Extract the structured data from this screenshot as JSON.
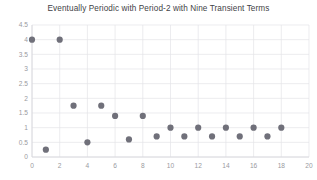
{
  "chart_data": {
    "type": "scatter",
    "title": "Eventually Periodic with Period-2 with Nine Transient Terms",
    "xlabel": "",
    "ylabel": "",
    "xlim": [
      0,
      20
    ],
    "ylim": [
      0,
      4.5
    ],
    "xticks": [
      0,
      2,
      4,
      6,
      8,
      10,
      12,
      14,
      16,
      18,
      20
    ],
    "yticks": [
      0,
      0.5,
      1,
      1.5,
      2,
      2.5,
      3,
      3.5,
      4,
      4.5
    ],
    "xtick_labels": [
      "0",
      "2",
      "4",
      "6",
      "8",
      "10",
      "12",
      "14",
      "16",
      "18",
      "20"
    ],
    "ytick_labels": [
      "0",
      "0.5",
      "1",
      "1.5",
      "2",
      "2.5",
      "3",
      "3.5",
      "4",
      "4.5"
    ],
    "grid": true,
    "legend": false,
    "marker_color": "#70707a",
    "marker_size": 3.1,
    "x": [
      0,
      1,
      2,
      3,
      4,
      5,
      6,
      7,
      8,
      9,
      10,
      11,
      12,
      13,
      14,
      15,
      16,
      17,
      18
    ],
    "y": [
      4,
      0.25,
      4,
      1.75,
      0.5,
      1.75,
      1.4,
      0.6,
      1.4,
      0.7,
      1,
      0.7,
      1,
      0.7,
      1,
      0.7,
      1,
      0.7,
      1
    ],
    "transient_terms": 9,
    "period": 2
  }
}
